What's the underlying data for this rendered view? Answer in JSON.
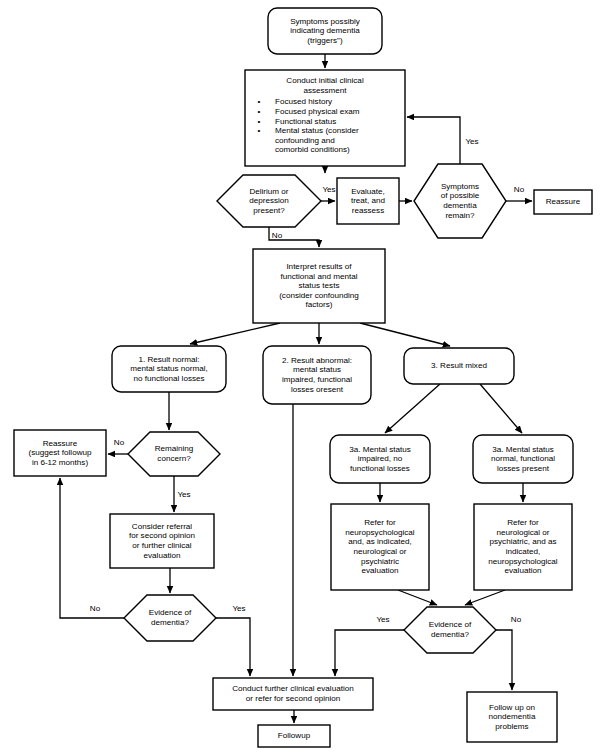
{
  "diagram": {
    "stroke_color": "#000000",
    "fill_color": "#ffffff",
    "background_color": "#ffffff"
  },
  "nodes": [
    {
      "id": "symptoms-trigger",
      "name": "symptoms-possibly-indicating-dementia",
      "shape": "rounded-rect",
      "x": 268,
      "y": 8,
      "w": 114,
      "h": 46,
      "lines": [
        "Symptoms possibly",
        "indicating dementia",
        "(triggers\")"
      ]
    },
    {
      "id": "initial-assessment",
      "name": "conduct-initial-clinical-assessment",
      "shape": "rect",
      "x": 245,
      "y": 70,
      "w": 160,
      "h": 96,
      "lines": [
        "Conduct initial clinical",
        "assessment"
      ],
      "bullets": [
        "Focused history",
        "Focused physical exam",
        "Functional status",
        "Mental status (consider"
      ],
      "bullet_cont": [
        "confounding and",
        "comorbid conditions)"
      ]
    },
    {
      "id": "delirium-depression",
      "name": "delirium-or-depression-present-decision",
      "shape": "hexagon",
      "x": 217,
      "y": 175,
      "w": 104,
      "h": 52,
      "lines": [
        "Delirium or",
        "depression",
        "present?"
      ]
    },
    {
      "id": "evaluate-treat",
      "name": "evaluate-treat-and-reassess",
      "shape": "rect",
      "x": 337,
      "y": 178,
      "w": 62,
      "h": 46,
      "lines": [
        "Evaluate,",
        "treat, and",
        "reassess"
      ]
    },
    {
      "id": "symptoms-remain",
      "name": "symptoms-of-possible-dementia-remain-decision",
      "shape": "hexagon",
      "x": 414,
      "y": 164,
      "w": 92,
      "h": 74,
      "lines": [
        "Symptoms",
        "of possible",
        "dementia",
        "remain?"
      ]
    },
    {
      "id": "reassure-top",
      "name": "reassure-box",
      "shape": "rect",
      "x": 534,
      "y": 190,
      "w": 58,
      "h": 24,
      "lines": [
        "Reassure"
      ]
    },
    {
      "id": "interpret-results",
      "name": "interpret-results-of-tests",
      "shape": "rect",
      "x": 253,
      "y": 249,
      "w": 132,
      "h": 74,
      "lines": [
        "Interpret results of",
        "functional and mental",
        "status tests",
        "(consider confounding",
        "factors)"
      ]
    },
    {
      "id": "result-normal",
      "name": "result-normal-outcome",
      "shape": "rounded-rect",
      "x": 112,
      "y": 346,
      "w": 114,
      "h": 46,
      "lines": [
        "1. Result normal:",
        "mental status normal,",
        "no functional losses"
      ]
    },
    {
      "id": "result-abnormal",
      "name": "result-abnormal-outcome",
      "shape": "rounded-rect",
      "x": 263,
      "y": 346,
      "w": 108,
      "h": 58,
      "lines": [
        "2. Result abnormal:",
        "mental status",
        "impaired, functional",
        "losses oresent"
      ]
    },
    {
      "id": "result-mixed",
      "name": "result-mixed-outcome",
      "shape": "rounded-rect",
      "x": 404,
      "y": 348,
      "w": 110,
      "h": 36,
      "lines": [
        "3. Result mixed"
      ]
    },
    {
      "id": "remaining-concern",
      "name": "remaining-concern-decision",
      "shape": "hexagon",
      "x": 128,
      "y": 432,
      "w": 92,
      "h": 44,
      "lines": [
        "Remaining",
        "concern?"
      ]
    },
    {
      "id": "reassure-followup",
      "name": "reassure-suggest-followup-box",
      "shape": "rect",
      "x": 14,
      "y": 430,
      "w": 92,
      "h": 46,
      "lines": [
        "Reassure",
        "(suggest followup",
        "in 6-12 months)"
      ]
    },
    {
      "id": "consider-referral",
      "name": "consider-referral-second-opinion",
      "shape": "rect",
      "x": 110,
      "y": 514,
      "w": 104,
      "h": 54,
      "lines": [
        "Consider referral",
        "for second opinion",
        "or further clinical",
        "evaluation"
      ]
    },
    {
      "id": "evidence-left",
      "name": "evidence-of-dementia-decision-left",
      "shape": "hexagon",
      "x": 124,
      "y": 595,
      "w": 92,
      "h": 46,
      "lines": [
        "Evidence of",
        "dementia?"
      ]
    },
    {
      "id": "mixed-3a-impaired",
      "name": "mental-status-impaired-no-functional-losses",
      "shape": "rounded-rect",
      "x": 330,
      "y": 435,
      "w": 100,
      "h": 48,
      "lines": [
        "3a. Mental status",
        "impaired, no",
        "functional losses"
      ]
    },
    {
      "id": "mixed-3a-normal",
      "name": "mental-status-normal-functional-losses-present",
      "shape": "rounded-rect",
      "x": 473,
      "y": 435,
      "w": 100,
      "h": 48,
      "lines": [
        "3a. Mental status",
        "normal, functional",
        "losses present"
      ]
    },
    {
      "id": "refer-neuropsych",
      "name": "refer-for-neuropsychological-evaluation",
      "shape": "rect",
      "x": 331,
      "y": 504,
      "w": 98,
      "h": 86,
      "lines": [
        "Refer for",
        "neuropsychological",
        "and, as indicated,",
        "neurological or",
        "psychiatric",
        "evaluation"
      ]
    },
    {
      "id": "refer-neuro-psych",
      "name": "refer-for-neurological-or-psychiatric-evaluation",
      "shape": "rect",
      "x": 474,
      "y": 504,
      "w": 98,
      "h": 86,
      "lines": [
        "Refer for",
        "neurological or",
        "psychiatric, and as",
        "indicated,",
        "neuropsychological",
        "evaluation"
      ]
    },
    {
      "id": "evidence-right",
      "name": "evidence-of-dementia-decision-right",
      "shape": "hexagon",
      "x": 404,
      "y": 607,
      "w": 92,
      "h": 46,
      "lines": [
        "Evidence of",
        "dementia?"
      ]
    },
    {
      "id": "conduct-further",
      "name": "conduct-further-clinical-evaluation",
      "shape": "rect",
      "x": 213,
      "y": 678,
      "w": 160,
      "h": 32,
      "lines": [
        "Conduct further clinical evaluation",
        "or refer for second opinion"
      ]
    },
    {
      "id": "followup",
      "name": "followup-box",
      "shape": "rect",
      "x": 258,
      "y": 725,
      "w": 72,
      "h": 22,
      "lines": [
        "Followup"
      ]
    },
    {
      "id": "followup-nondementia",
      "name": "follow-up-on-nondementia-problems",
      "shape": "rect",
      "x": 467,
      "y": 692,
      "w": 90,
      "h": 50,
      "lines": [
        "Follow up on",
        "nondementia",
        "problems"
      ]
    }
  ],
  "connectors": [
    {
      "name": "symptoms-to-assessment",
      "path": "M325,54 L325,68",
      "arrow": "end"
    },
    {
      "name": "assessment-to-delirium",
      "path": "M325,166 L325,173",
      "arrow": "end"
    },
    {
      "name": "delirium-yes-to-evaluate",
      "path": "M321,201 L335,201",
      "arrow": "end"
    },
    {
      "name": "evaluate-to-symptoms-remain",
      "path": "M399,201 L412,201",
      "arrow": "end"
    },
    {
      "name": "symptoms-remain-no-reassure",
      "path": "M506,201 L532,201",
      "arrow": "end"
    },
    {
      "name": "symptoms-remain-yes-loop",
      "path": "M460,164 L460,117 L407,117",
      "arrow": "end"
    },
    {
      "name": "delirium-no-to-interpret",
      "path": "M269,227 L269,240 L319,240 L319,247",
      "arrow": "end"
    },
    {
      "name": "interpret-to-result-normal",
      "path": "M280,323 L190,344",
      "arrow": "end"
    },
    {
      "name": "interpret-to-result-abnormal",
      "path": "M319,323 L319,344",
      "arrow": "end"
    },
    {
      "name": "interpret-to-result-mixed",
      "path": "M360,323 L450,346",
      "arrow": "end"
    },
    {
      "name": "result-normal-to-concern",
      "path": "M169,392 L169,430",
      "arrow": "end"
    },
    {
      "name": "concern-no-to-reassure",
      "path": "M128,454 L108,454",
      "arrow": "end"
    },
    {
      "name": "concern-yes-to-referral",
      "path": "M174,476 L174,512",
      "arrow": "end"
    },
    {
      "name": "referral-to-evidence-left",
      "path": "M170,568 L170,593",
      "arrow": "end"
    },
    {
      "name": "evidence-left-no-up-reassure",
      "path": "M124,618 L60,618 L60,478",
      "arrow": "end"
    },
    {
      "name": "evidence-left-yes-to-conduct",
      "path": "M216,618 L250,618 L250,676",
      "arrow": "end"
    },
    {
      "name": "result-abnormal-to-conduct",
      "path": "M293,404 L293,676",
      "arrow": "end"
    },
    {
      "name": "mixed-to-3a-impaired",
      "path": "M440,384 L385,433",
      "arrow": "end"
    },
    {
      "name": "mixed-to-3a-normal",
      "path": "M480,384 L522,433",
      "arrow": "end"
    },
    {
      "name": "3a-impaired-to-refer",
      "path": "M380,483 L380,502",
      "arrow": "end"
    },
    {
      "name": "3a-normal-to-refer",
      "path": "M523,483 L523,502",
      "arrow": "end"
    },
    {
      "name": "refer-left-to-evidence-right",
      "path": "M398,590 L437,605",
      "arrow": "end"
    },
    {
      "name": "refer-right-to-evidence-right",
      "path": "M505,590 L465,605",
      "arrow": "end"
    },
    {
      "name": "evidence-right-yes-conduct",
      "path": "M404,630 L335,630 L335,676",
      "arrow": "end"
    },
    {
      "name": "evidence-right-no-nondementia",
      "path": "M496,630 L512,630 L512,690",
      "arrow": "end"
    },
    {
      "name": "conduct-to-followup",
      "path": "M294,710 L294,723",
      "arrow": "end"
    }
  ],
  "edge_labels": [
    {
      "name": "edge-label-yes-delirium",
      "text": "Yes",
      "x": 329,
      "y": 190
    },
    {
      "name": "edge-label-no-symptoms-remain",
      "text": "No",
      "x": 519,
      "y": 190
    },
    {
      "name": "edge-label-yes-symptoms-remain",
      "text": "Yes",
      "x": 472,
      "y": 142
    },
    {
      "name": "edge-label-no-delirium",
      "text": "No",
      "x": 277,
      "y": 236
    },
    {
      "name": "edge-label-no-concern",
      "text": "No",
      "x": 119,
      "y": 443
    },
    {
      "name": "edge-label-yes-concern",
      "text": "Yes",
      "x": 184,
      "y": 495
    },
    {
      "name": "edge-label-no-evidence-left",
      "text": "No",
      "x": 95,
      "y": 609
    },
    {
      "name": "edge-label-yes-evidence-left",
      "text": "Yes",
      "x": 239,
      "y": 609
    },
    {
      "name": "edge-label-yes-evidence-right",
      "text": "Yes",
      "x": 383,
      "y": 620
    },
    {
      "name": "edge-label-no-evidence-right",
      "text": "No",
      "x": 516,
      "y": 620
    }
  ]
}
